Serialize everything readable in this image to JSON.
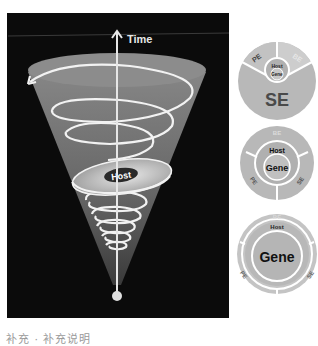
{
  "diagram": {
    "axis_label": "Time",
    "cone_center_label": "Host",
    "colors": {
      "panel": "#0b0b0b",
      "cone": "#7a7a7a",
      "spiral": "#f2f2f2",
      "host_ellipse": "#c8c8c8",
      "host_badge": "#2a2a2a",
      "circle_fill": "#b5b5b5",
      "circle_dim": "#cfcfcf"
    }
  },
  "circles": [
    {
      "id": "circle-1",
      "inner_top": "Host",
      "inner_bottom": "Gene",
      "segments": [
        {
          "label": "PE",
          "position": "top-left"
        },
        {
          "label": "BE",
          "position": "top-right"
        },
        {
          "label": "SE",
          "position": "bottom",
          "emphasis": "large"
        }
      ]
    },
    {
      "id": "circle-2",
      "inner_top": "Host",
      "inner_bottom": "Gene",
      "segments": [
        {
          "label": "BE",
          "position": "top"
        },
        {
          "label": "PE",
          "position": "bottom-left"
        },
        {
          "label": "SE",
          "position": "bottom-right"
        }
      ]
    },
    {
      "id": "circle-3",
      "inner_top": "Host",
      "inner_bottom": "Gene",
      "segments": [
        {
          "label": "BE",
          "position": "top"
        },
        {
          "label": "PE",
          "position": "bottom-left"
        },
        {
          "label": "SE",
          "position": "bottom-right"
        }
      ]
    }
  ],
  "caption": "补充 · 补充说明"
}
